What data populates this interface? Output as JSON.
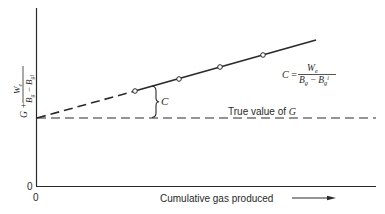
{
  "diagram": {
    "axes": {
      "y_axis_label": {
        "prefix": "G + ",
        "numerator": "W",
        "numerator_sub": "e",
        "denominator_a": "B",
        "denominator_a_sub": "g",
        "denominator_minus": " − ",
        "denominator_b": "B",
        "denominator_b_sub": "gi"
      },
      "y_origin_label": "0",
      "x_origin_label": "0",
      "x_axis_label": "Cumulative gas produced"
    },
    "lines": {
      "true_value_label_prefix": "True value of ",
      "true_value_label_var": "G"
    },
    "annotations": {
      "brace_label": "C",
      "formula": {
        "lhs": "C",
        "equals": " = ",
        "numerator": "W",
        "numerator_sub": "e",
        "denominator_a": "B",
        "denominator_a_sub": "g",
        "denominator_minus": " − ",
        "denominator_b": "B",
        "denominator_b_sub": "g",
        "denominator_b_sup": "i"
      }
    },
    "data_points": [
      {
        "x": 135,
        "y": 91
      },
      {
        "x": 179,
        "y": 79
      },
      {
        "x": 220,
        "y": 67
      },
      {
        "x": 263,
        "y": 55
      }
    ],
    "colors": {
      "ink": "#2a2a2a",
      "background": "#ffffff"
    }
  }
}
